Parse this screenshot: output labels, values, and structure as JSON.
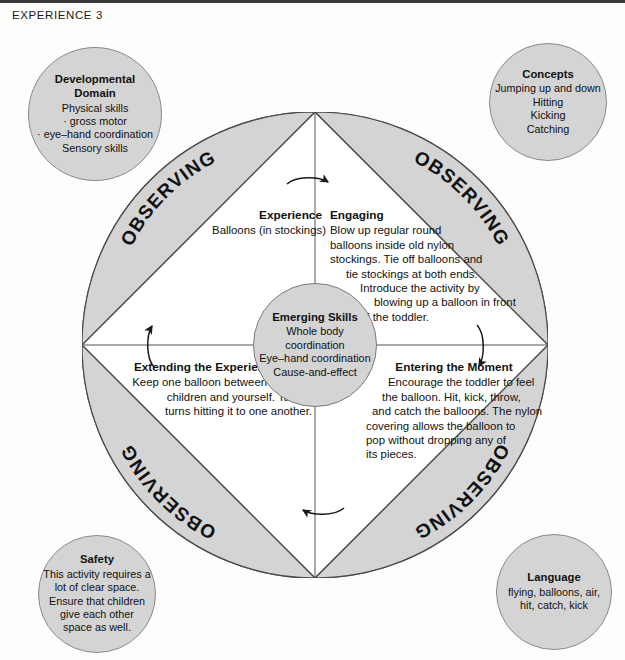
{
  "header": {
    "label": "EXPERIENCE 3"
  },
  "colors": {
    "shaded_fill": "#d4d4d4",
    "stroke": "#4a4a4a",
    "text": "#111111",
    "page_background": "#fdfdfc"
  },
  "wheel": {
    "segment_label": "OBSERVING",
    "segments": [
      {
        "position": "top-left",
        "label": "OBSERVING"
      },
      {
        "position": "top-right",
        "label": "OBSERVING"
      },
      {
        "position": "bottom-right",
        "label": "OBSERVING"
      },
      {
        "position": "bottom-left",
        "label": "OBSERVING"
      }
    ],
    "arrows": [
      {
        "position": "top",
        "direction": "right"
      },
      {
        "position": "right",
        "direction": "down"
      },
      {
        "position": "bottom",
        "direction": "left"
      },
      {
        "position": "left",
        "direction": "up"
      }
    ]
  },
  "quadrants": {
    "experience": {
      "title": "Experience",
      "lines": [
        "Balloons (in stockings)"
      ]
    },
    "engaging": {
      "title": "Engaging",
      "lines": [
        "Blow up regular round",
        "balloons inside old nylon",
        "stockings. Tie off balloons and",
        "tie stockings at both ends.",
        "Introduce the activity by",
        "blowing up a balloon in front",
        "of the toddler."
      ]
    },
    "extending": {
      "title": "Extending the Experience",
      "lines": [
        "Keep one balloon between two",
        "children and yourself. Take",
        "turns hitting it to one another."
      ]
    },
    "entering": {
      "title": "Entering the Moment",
      "lines": [
        "Encourage the toddler to feel",
        "the balloon. Hit, kick, throw,",
        "and catch the balloons. The nylon",
        "covering allows the balloon to",
        "pop without dropping any of",
        "its pieces."
      ]
    }
  },
  "center": {
    "title": "Emerging Skills",
    "lines": [
      "Whole body",
      "coordination",
      "Eye–hand coordination",
      "Cause-and-effect"
    ]
  },
  "satellites": {
    "developmental_domain": {
      "title_line1": "Developmental",
      "title_line2": "Domain",
      "lines": [
        "Physical skills",
        "· gross motor",
        "· eye–hand coordination",
        "Sensory skills"
      ]
    },
    "concepts": {
      "title": "Concepts",
      "lines": [
        "Jumping up and down",
        "Hitting",
        "Kicking",
        "Catching"
      ]
    },
    "safety": {
      "title": "Safety",
      "lines": [
        "This activity requires a",
        "lot of clear space.",
        "Ensure that children",
        "give each other",
        "space as well."
      ]
    },
    "language": {
      "title": "Language",
      "lines": [
        "flying, balloons, air,",
        "hit, catch, kick"
      ]
    }
  }
}
